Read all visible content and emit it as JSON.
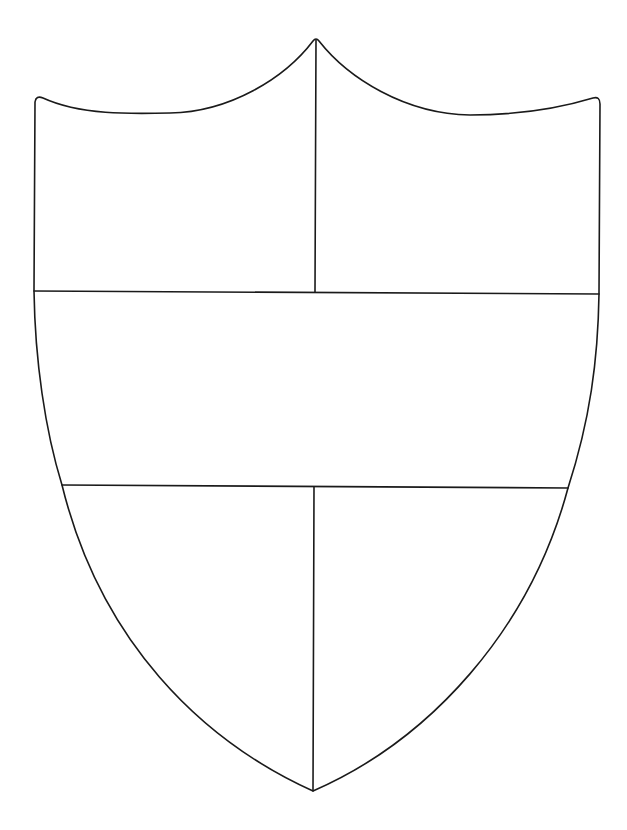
{
  "figure": {
    "background_color": "#ffffff",
    "line_color": "#1a1a1a",
    "sections": [
      {
        "id": "upper-left",
        "label": ""
      },
      {
        "id": "upper-right",
        "label": ""
      },
      {
        "id": "middle-band",
        "label": ""
      },
      {
        "id": "lower-left",
        "label": ""
      },
      {
        "id": "lower-right",
        "label": ""
      }
    ]
  }
}
